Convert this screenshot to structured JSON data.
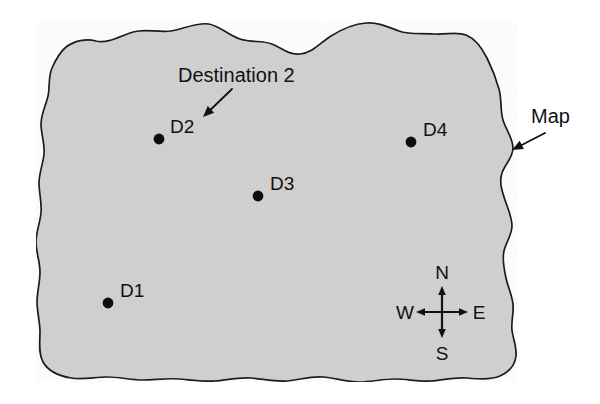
{
  "figure": {
    "background_color": "#ffffff",
    "map_fill_color": "#cfcfcf",
    "map_outline_color": "#1a1a1a",
    "marker_color": "#0d0d0d",
    "text_color": "#111111"
  },
  "callouts": [
    {
      "id": "destination-2",
      "label": "Destination 2",
      "label_x": 178,
      "label_y": 82,
      "arrow_from_x": 232,
      "arrow_from_y": 89,
      "arrow_to_x": 203,
      "arrow_to_y": 117
    },
    {
      "id": "map",
      "label": "Map",
      "label_x": 531,
      "label_y": 123,
      "arrow_from_x": 545,
      "arrow_from_y": 133,
      "arrow_to_x": 512,
      "arrow_to_y": 150
    }
  ],
  "destinations": [
    {
      "id": "D1",
      "label": "D1",
      "dot_x": 108,
      "dot_y": 303,
      "label_x": 120,
      "label_y": 297
    },
    {
      "id": "D2",
      "label": "D2",
      "dot_x": 159,
      "dot_y": 139,
      "label_x": 170,
      "label_y": 133
    },
    {
      "id": "D3",
      "label": "D3",
      "dot_x": 258,
      "dot_y": 196,
      "label_x": 270,
      "label_y": 190
    },
    {
      "id": "D4",
      "label": "D4",
      "dot_x": 411,
      "dot_y": 142,
      "label_x": 423,
      "label_y": 136
    }
  ],
  "compass": {
    "center_x": 442,
    "center_y": 312,
    "arm_length": 26,
    "directions": [
      {
        "id": "north",
        "label": "N",
        "label_x": 442,
        "label_y": 279
      },
      {
        "id": "south",
        "label": "S",
        "label_x": 442,
        "label_y": 360
      },
      {
        "id": "east",
        "label": "E",
        "label_x": 479,
        "label_y": 319
      },
      {
        "id": "west",
        "label": "W",
        "label_x": 405,
        "label_y": 319
      }
    ]
  },
  "map_shape": {
    "description": "Irregular wavy-edged landmass polygon",
    "path": "M 66,47 C 74,41 86,38 96,41 C 108,44 120,36 133,32 C 146,28 158,33 171,31 C 184,29 196,22 209,24 C 220,26 228,35 240,39 C 252,43 262,40 272,44 C 282,48 288,55 300,54 C 312,53 320,43 331,36 C 342,29 354,24 366,23 C 378,22 388,27 399,31 C 410,35 422,33 434,34 C 446,35 456,31 466,35 C 476,39 482,48 487,58 C 492,68 496,78 499,89 C 502,100 500,110 503,120 C 506,130 513,138 513,148 C 513,158 505,164 502,173 C 499,182 502,191 505,200 C 508,209 512,217 512,226 C 512,235 506,242 504,251 C 502,260 504,269 506,278 C 508,287 512,295 513,304 C 514,313 511,321 512,330 C 513,339 517,347 516,356 C 515,365 509,372 500,376 C 490,380 478,379 467,378 C 455,377 443,380 431,381 C 419,382 407,379 395,379 C 383,379 371,382 359,382 C 347,382 335,378 323,377 C 311,376 299,380 287,381 C 275,382 263,379 251,378 C 239,377 227,380 215,381 C 203,382 191,380 179,379 C 167,378 155,380 143,380 C 131,380 119,377 107,377 C 95,377 83,380 71,378 C 59,376 48,371 43,362 C 38,353 40,342 40,332 C 40,322 37,312 37,302 C 37,292 40,282 40,272 C 40,262 36,252 36,242 C 36,232 40,223 41,213 C 42,203 39,193 39,183 C 39,173 43,164 44,154 C 45,144 41,134 41,124 C 41,114 46,105 48,96 C 50,87 48,77 52,68 C 56,59 60,52 66,47 Z"
  }
}
